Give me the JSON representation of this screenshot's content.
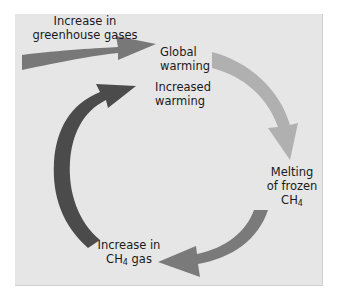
{
  "diagram": {
    "colors": {
      "panel_background": "#e6e6e6",
      "input_arrow": "#787878",
      "right_arrow": "#b0b0b0",
      "bottom_arrow": "#7a7a7a",
      "left_arrow": "#4b4b4b"
    },
    "nodes": [
      {
        "id": "input",
        "lines": [
          "Increase in",
          "greenhouse gases"
        ]
      },
      {
        "id": "global_warming",
        "lines": [
          "Global",
          "warming"
        ]
      },
      {
        "id": "increased_warming",
        "lines": [
          "Increased",
          "warming"
        ]
      },
      {
        "id": "melting",
        "lines": [
          "Melting",
          "of frozen"
        ],
        "formula": {
          "base": "CH",
          "sub": "4",
          "suffix": ""
        }
      },
      {
        "id": "increase_ch4",
        "lines": [
          "Increase in"
        ],
        "formula": {
          "base": "CH",
          "sub": "4",
          "suffix": " gas"
        }
      }
    ],
    "edges": [
      {
        "from": "input",
        "to": "global_warming"
      },
      {
        "from": "global_warming",
        "to": "melting"
      },
      {
        "from": "melting",
        "to": "increase_ch4"
      },
      {
        "from": "increase_ch4",
        "to": "increased_warming"
      }
    ]
  }
}
